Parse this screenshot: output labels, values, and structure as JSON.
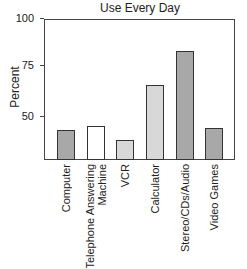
{
  "chart_data": {
    "type": "bar",
    "title": "Use Every Day",
    "xlabel": "",
    "ylabel": "Percent",
    "ylim": [
      30,
      100
    ],
    "yticks": [
      50,
      75,
      100
    ],
    "grid": false,
    "legend": null,
    "categories": [
      "Computer",
      "Telephone Answering Machine",
      "VCR",
      "Calculator",
      "Stereo/CDs/Audio",
      "Video Games"
    ],
    "values": [
      43,
      45,
      38,
      65,
      82,
      44
    ],
    "bar_colors": [
      "#a8a8a8",
      "#ffffff",
      "#d8d8d8",
      "#d8d8d8",
      "#a8a8a8",
      "#a8a8a8"
    ]
  },
  "labels": {
    "title": "Use Every Day",
    "ylabel": "Percent",
    "ticks": [
      "100",
      "75",
      "50"
    ],
    "x": [
      "Computer",
      "Telephone Answering\nMachine",
      "VCR",
      "Calculator",
      "Stereo/CDs/Audio",
      "Video Games"
    ]
  }
}
